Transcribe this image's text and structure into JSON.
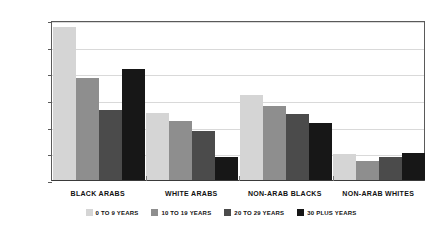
{
  "chart_data": {
    "type": "bar",
    "title": "",
    "xlabel": "",
    "ylabel": "PERCENTAGE",
    "ylim": [
      0,
      30
    ],
    "ytick_labels": [
      "0.0",
      "5.0",
      "10.0",
      "15.0",
      "20.0",
      "25.0",
      "30.0"
    ],
    "ytick_values": [
      0,
      5,
      10,
      15,
      20,
      25,
      30
    ],
    "grid": true,
    "legend_position": "bottom",
    "categories": [
      "BLACK ARABS",
      "WHITE ARABS",
      "NON-ARAB BLACKS",
      "NON-ARAB WHITES"
    ],
    "series": [
      {
        "name": "0 TO 9 YEARS",
        "color": "#d5d5d5",
        "values": [
          28.6,
          12.5,
          16.0,
          4.8
        ]
      },
      {
        "name": "10 TO 19 YEARS",
        "color": "#8e8e8e",
        "values": [
          19.2,
          11.0,
          13.9,
          3.6
        ]
      },
      {
        "name": "20 TO 29 YEARS",
        "color": "#4b4b4b",
        "values": [
          13.1,
          9.1,
          12.3,
          4.3
        ]
      },
      {
        "name": "30 PLUS YEARS",
        "color": "#171717",
        "values": [
          20.9,
          4.3,
          10.7,
          5.1
        ]
      }
    ]
  },
  "colors": {
    "axis": "#5a5a5a",
    "grid": "#d9d9d9",
    "text": "#111111",
    "background": "#ffffff"
  }
}
